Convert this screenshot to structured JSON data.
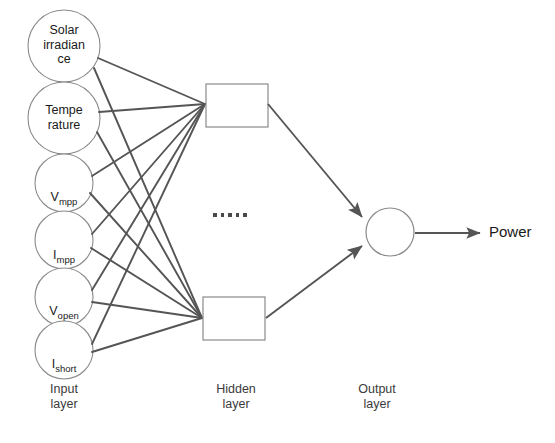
{
  "diagram": {
    "colors": {
      "stroke": "#555555",
      "node_stroke": "#8a8a8a",
      "text": "#1a1a1a",
      "layer_text": "#3a3a3a",
      "background": "#ffffff"
    },
    "input_layer": {
      "label": "Input\nlayer",
      "nodes": [
        {
          "id": "solar-irradiance",
          "text": "Solar\nirradian\nce",
          "base": "Solar irradiance",
          "sub": "",
          "cx": 64,
          "cy": 46,
          "r": 36
        },
        {
          "id": "temperature",
          "text": "Tempe\nrature",
          "base": "Temperature",
          "sub": "",
          "cx": 64,
          "cy": 118,
          "r": 36
        },
        {
          "id": "v-mpp",
          "text": "Vmpp",
          "base": "V",
          "sub": "mpp",
          "cx": 64,
          "cy": 183,
          "r": 29
        },
        {
          "id": "i-mpp",
          "text": "Impp",
          "base": "I",
          "sub": "mpp",
          "cx": 64,
          "cy": 240,
          "r": 29
        },
        {
          "id": "v-open",
          "text": "Vopen",
          "base": "V",
          "sub": "open",
          "cx": 64,
          "cy": 297,
          "r": 29
        },
        {
          "id": "i-short",
          "text": "Ishort",
          "base": "I",
          "sub": "short",
          "cx": 64,
          "cy": 350,
          "r": 29
        }
      ]
    },
    "hidden_layer": {
      "label": "Hidden\nlayer",
      "ellipsis": "......",
      "nodes": [
        {
          "id": "hidden-top",
          "x": 206,
          "y": 84,
          "w": 62,
          "h": 43
        },
        {
          "id": "hidden-bottom",
          "x": 203,
          "y": 297,
          "w": 62,
          "h": 43
        }
      ]
    },
    "output_layer": {
      "label": "Output\nlayer",
      "node": {
        "id": "output-neuron",
        "cx": 390,
        "cy": 232,
        "r": 24
      },
      "output_text": "Power"
    }
  }
}
